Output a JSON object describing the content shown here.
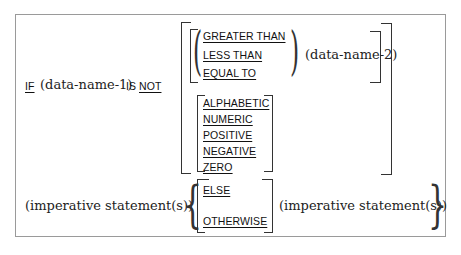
{
  "syntax": {
    "if_keyword": "IF",
    "operand1": "(data-name-1)",
    "is_keyword": "IS",
    "not_keyword": "NOT",
    "relational_options": [
      "GREATER THAN",
      "LESS THAN",
      "EQUAL TO"
    ],
    "operand2": "(data-name-2)",
    "class_options": [
      "ALPHABETIC",
      "NUMERIC",
      "POSITIVE",
      "NEGATIVE",
      "ZERO"
    ],
    "imperative_left": "(imperative statement(s))",
    "else_options": [
      "ELSE",
      "OTHERWISE"
    ],
    "imperative_right": "(imperative statement(s))"
  }
}
